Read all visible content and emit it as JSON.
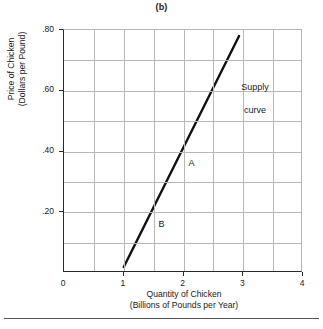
{
  "figure": {
    "panel_title": "(b)",
    "background_color": "#ffffff",
    "axis_color": "#2b2b2b",
    "grid_color": "#b9b9b9",
    "curve_color": "#111111"
  },
  "chart_data": {
    "type": "line",
    "title": "(b)",
    "subtitle": "",
    "xlabel": "Quantity of Chicken\n(Billions of Pounds per Year)",
    "xlabel_line1": "Quantity of Chicken",
    "xlabel_line2": "(Billions of Pounds per Year)",
    "ylabel": "Price of Chicken\n(Dollars per Pound)",
    "ylabel_line1": "Price of Chicken",
    "ylabel_line2": "(Dollars per Pound)",
    "xlim": [
      0,
      4
    ],
    "ylim": [
      0,
      0.8
    ],
    "grid": true,
    "grid_x_step": 0.5,
    "grid_y_step": 0.1,
    "legend": "none",
    "x_tick_labels": [
      "0",
      "1",
      "2",
      "3",
      "4"
    ],
    "x_tick_values": [
      0,
      1,
      2,
      3,
      4
    ],
    "y_tick_labels": [
      ".20",
      ".40",
      ".60",
      ".80"
    ],
    "y_tick_values": [
      0.2,
      0.4,
      0.6,
      0.8
    ],
    "series": [
      {
        "name": "Supply curve",
        "style": "straight-line",
        "x": [
          1.0,
          2.93
        ],
        "y": [
          0.02,
          0.78
        ],
        "points": [
          {
            "label": "B",
            "x": 1.5,
            "y": 0.2
          },
          {
            "label": "A",
            "x": 2.0,
            "y": 0.4
          }
        ]
      }
    ],
    "annotations": [
      {
        "name": "supply-curve-label",
        "text": "Supply\ncurve",
        "x": 3.35,
        "y": 0.645
      },
      {
        "name": "point-a-label",
        "text": "A",
        "x": 2.1,
        "y": 0.355
      },
      {
        "name": "point-b-label",
        "text": "B",
        "x": 1.6,
        "y": 0.155
      }
    ]
  },
  "annotations": {
    "supply_curve_line1": "Supply",
    "supply_curve_line2": "curve",
    "point_a": "A",
    "point_b": "B"
  },
  "axes": {
    "y_ticks": [
      {
        "label": ".80",
        "value": 0.8
      },
      {
        "label": ".60",
        "value": 0.6
      },
      {
        "label": ".40",
        "value": 0.4
      },
      {
        "label": ".20",
        "value": 0.2
      }
    ],
    "x_ticks": [
      {
        "label": "0",
        "value": 0
      },
      {
        "label": "1",
        "value": 1
      },
      {
        "label": "2",
        "value": 2
      },
      {
        "label": "3",
        "value": 3
      },
      {
        "label": "4",
        "value": 4
      }
    ]
  }
}
